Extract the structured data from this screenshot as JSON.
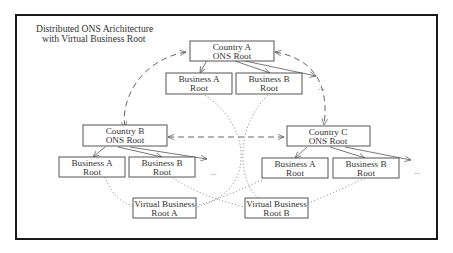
{
  "diagram": {
    "title_line1": "Distributed ONS Arichitecture",
    "title_line2": "with Virtual Business Root",
    "nodes": {
      "country_a": {
        "line1": "Country A",
        "line2": "ONS Root"
      },
      "country_a_business_a": {
        "line1": "Business A",
        "line2": "Root"
      },
      "country_a_business_b": {
        "line1": "Business B",
        "line2": "Root"
      },
      "country_b": {
        "line1": "Country B",
        "line2": "ONS Root"
      },
      "country_b_business_a": {
        "line1": "Business A",
        "line2": "Root"
      },
      "country_b_business_b": {
        "line1": "Business B",
        "line2": "Root"
      },
      "country_c": {
        "line1": "Country C",
        "line2": "ONS Root"
      },
      "country_c_business_a": {
        "line1": "Business A",
        "line2": "Root"
      },
      "country_c_business_b": {
        "line1": "Business B",
        "line2": "Root"
      },
      "virtual_root_a": {
        "line1": "Virtual Business",
        "line2": "Root A"
      },
      "virtual_root_b": {
        "line1": "Virtual Business",
        "line2": "Root B"
      }
    },
    "ellipsis": "...",
    "edges": [
      {
        "from": "country_a",
        "to": "country_b",
        "style": "dashed",
        "bidirectional": true
      },
      {
        "from": "country_a",
        "to": "country_c",
        "style": "dashed",
        "bidirectional": true
      },
      {
        "from": "country_b",
        "to": "country_c",
        "style": "dashed",
        "bidirectional": true
      },
      {
        "from": "country_a",
        "to": "country_a_business_a",
        "style": "arrow"
      },
      {
        "from": "country_a",
        "to": "country_a_business_b",
        "style": "arrow"
      },
      {
        "from": "country_a",
        "to": "...",
        "style": "arrow"
      },
      {
        "from": "country_b",
        "to": "country_b_business_a",
        "style": "arrow"
      },
      {
        "from": "country_b",
        "to": "country_b_business_b",
        "style": "arrow"
      },
      {
        "from": "country_b",
        "to": "...",
        "style": "arrow"
      },
      {
        "from": "country_c",
        "to": "country_c_business_a",
        "style": "arrow"
      },
      {
        "from": "country_c",
        "to": "country_c_business_b",
        "style": "arrow"
      },
      {
        "from": "country_c",
        "to": "...",
        "style": "arrow"
      },
      {
        "from": "virtual_root_a",
        "to": "country_a_business_a",
        "style": "dotted"
      },
      {
        "from": "virtual_root_a",
        "to": "country_b_business_a",
        "style": "dotted"
      },
      {
        "from": "virtual_root_a",
        "to": "country_c_business_a",
        "style": "dotted"
      },
      {
        "from": "virtual_root_b",
        "to": "country_a_business_b",
        "style": "dotted"
      },
      {
        "from": "virtual_root_b",
        "to": "country_b_business_b",
        "style": "dotted"
      },
      {
        "from": "virtual_root_b",
        "to": "country_c_business_b",
        "style": "dotted"
      }
    ]
  }
}
